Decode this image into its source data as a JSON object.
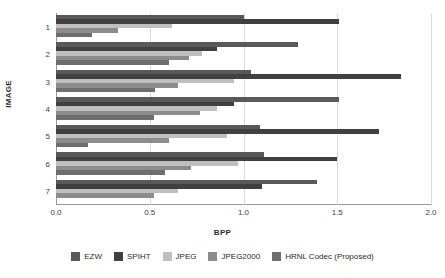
{
  "chart_data": {
    "type": "bar",
    "orientation": "horizontal",
    "title": "",
    "xlabel": "BPP",
    "ylabel": "IMAGE",
    "xlim": [
      0.0,
      2.0
    ],
    "xticks": [
      "0.0",
      "0.5",
      "1.0",
      "1.5",
      "2.0"
    ],
    "xtick_values": [
      0.0,
      0.5,
      1.0,
      1.5,
      2.0
    ],
    "categories": [
      "1",
      "2",
      "3",
      "4",
      "5",
      "6",
      "7"
    ],
    "grid": "vertical",
    "legend_position": "bottom",
    "series": [
      {
        "name": "EZW",
        "color": "#595959",
        "values": [
          1.0,
          1.29,
          1.04,
          1.51,
          1.09,
          1.11,
          1.39
        ]
      },
      {
        "name": "SPIHT",
        "color": "#404040",
        "values": [
          1.51,
          0.86,
          1.84,
          0.95,
          1.72,
          1.5,
          1.1
        ]
      },
      {
        "name": "JPEG",
        "color": "#bfbfbf",
        "values": [
          0.62,
          0.78,
          0.95,
          0.86,
          0.91,
          0.97,
          0.65
        ]
      },
      {
        "name": "JPEG2000",
        "color": "#8c8c8c",
        "values": [
          0.33,
          0.71,
          0.65,
          0.77,
          0.6,
          0.72,
          0.52
        ]
      },
      {
        "name": "HRNL Codec (Proposed)",
        "color": "#6e6e6e",
        "values": [
          0.19,
          0.6,
          0.53,
          0.52,
          0.17,
          0.58,
          null
        ]
      }
    ]
  }
}
